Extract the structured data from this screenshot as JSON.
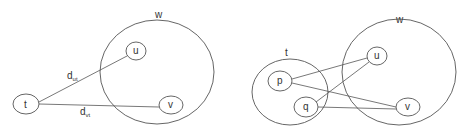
{
  "left": {
    "set_w": {
      "label": "w",
      "cx": 157,
      "cy": 72,
      "rx": 57,
      "ry": 52,
      "lx": 155,
      "ly": 18
    },
    "nodes": [
      {
        "id": "u",
        "label": "u",
        "cx": 136,
        "cy": 51,
        "rx": 10,
        "ry": 9
      },
      {
        "id": "v",
        "label": "v",
        "cx": 171,
        "cy": 105,
        "rx": 12,
        "ry": 9
      },
      {
        "id": "t",
        "label": "t",
        "cx": 26,
        "cy": 104,
        "rx": 13,
        "ry": 10
      }
    ],
    "edges": [
      {
        "from": "t",
        "to": "u",
        "x1": 39,
        "y1": 102,
        "x2": 127,
        "y2": 56,
        "label": "d",
        "sub": "ut",
        "lx": 67,
        "ly": 79
      },
      {
        "from": "t",
        "to": "v",
        "x1": 39,
        "y1": 104,
        "x2": 159,
        "y2": 107,
        "label": "d",
        "sub": "vt",
        "lx": 80,
        "ly": 115
      }
    ]
  },
  "right": {
    "set_w": {
      "label": "w",
      "cx": 399,
      "cy": 72,
      "rx": 57,
      "ry": 53,
      "lx": 396,
      "ly": 23
    },
    "set_t": {
      "label": "t",
      "cx": 290,
      "cy": 92,
      "rx": 38,
      "ry": 33,
      "lx": 285,
      "ly": 56
    },
    "nodes": [
      {
        "id": "u",
        "label": "u",
        "cx": 377,
        "cy": 56,
        "rx": 10,
        "ry": 9
      },
      {
        "id": "v",
        "label": "v",
        "cx": 408,
        "cy": 107,
        "rx": 12,
        "ry": 9
      },
      {
        "id": "p",
        "label": "p",
        "cx": 280,
        "cy": 81,
        "rx": 12,
        "ry": 10
      },
      {
        "id": "q",
        "label": "q",
        "cx": 306,
        "cy": 107,
        "rx": 12,
        "ry": 10
      }
    ],
    "edges": [
      {
        "from": "p",
        "to": "u",
        "x1": 292,
        "y1": 79,
        "x2": 367,
        "y2": 58
      },
      {
        "from": "p",
        "to": "v",
        "x1": 292,
        "y1": 83,
        "x2": 396,
        "y2": 107
      },
      {
        "from": "q",
        "to": "u",
        "x1": 316,
        "y1": 102,
        "x2": 369,
        "y2": 62
      },
      {
        "from": "q",
        "to": "v",
        "x1": 318,
        "y1": 107,
        "x2": 396,
        "y2": 109
      }
    ]
  }
}
